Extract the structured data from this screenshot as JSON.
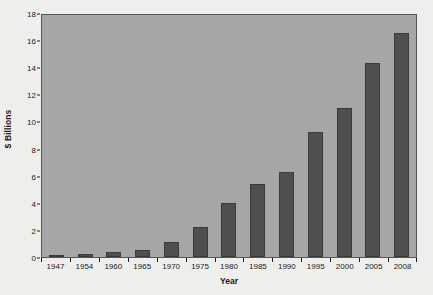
{
  "chart_data": {
    "type": "bar",
    "title": "",
    "xlabel": "Year",
    "ylabel": "$ Billions",
    "categories": [
      "1947",
      "1954",
      "1960",
      "1965",
      "1970",
      "1975",
      "1980",
      "1985",
      "1990",
      "1995",
      "2000",
      "2005",
      "2008"
    ],
    "values": [
      0.1,
      0.25,
      0.35,
      0.5,
      1.1,
      2.2,
      4.0,
      5.4,
      6.3,
      9.2,
      11.0,
      14.3,
      16.5
    ],
    "ylim": [
      0,
      18
    ],
    "yticks": [
      0,
      2,
      4,
      6,
      8,
      10,
      12,
      14,
      16,
      18
    ],
    "ytick_labels": [
      "0",
      "2",
      "4",
      "6",
      "8",
      "10",
      "12",
      "14",
      "16",
      "18"
    ],
    "grid": false,
    "legend": null,
    "colors": {
      "bar_fill": "#4f4f4f",
      "bar_edge": "#3a3a3a",
      "plot_background": "#a6a6a6",
      "figure_background": "#eeeeec",
      "axis": "#555555",
      "text": "#1a1a1a"
    }
  }
}
